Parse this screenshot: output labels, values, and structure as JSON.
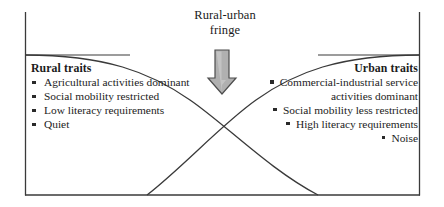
{
  "diagram": {
    "title": "Rural-urban fringe",
    "title_line1": "Rural-urban",
    "title_line2": "fringe",
    "arrow": {
      "icon": "down-arrow-icon",
      "direction": "down",
      "fill_color": "#b3b3b3",
      "stroke_color": "#4d4d4d"
    },
    "frame": {
      "border_color": "#3a3a3a",
      "background": "#ffffff"
    },
    "curves": {
      "stroke_color": "#3a3a3a",
      "rural_curve_label": "rural-traits-curve",
      "urban_curve_label": "urban-traits-curve",
      "crossing_point": "center"
    },
    "left": {
      "heading": "Rural traits",
      "bullet_glyph": "square-bullet-icon",
      "items": [
        "Agricultural activities dominant",
        "Social mobility restricted",
        "Low literacy requirements",
        "Quiet"
      ]
    },
    "right": {
      "heading": "Urban traits",
      "bullet_glyph": "square-bullet-icon",
      "items": [
        "Commercial-industrial service activities dominant",
        "Social mobility less restricted",
        "High literacy requirements",
        "Noise"
      ]
    }
  }
}
